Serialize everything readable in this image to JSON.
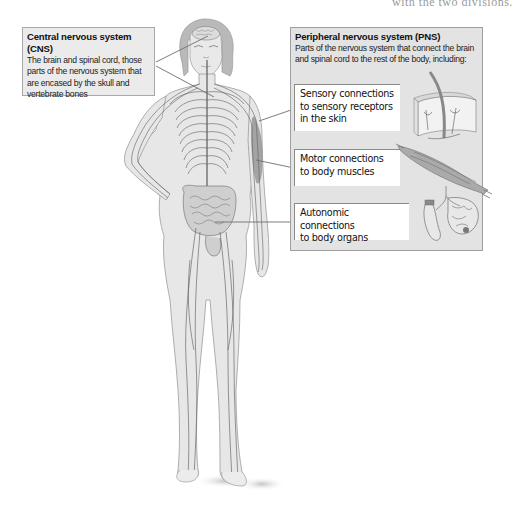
{
  "page": {
    "top_cut_text": "with the two divisions."
  },
  "cns": {
    "title": "Central nervous system (CNS)",
    "description_lines": [
      "The brain and spinal cord, those",
      "parts of the nervous system that",
      "are encased by the skull and",
      "vertebrate bones"
    ]
  },
  "pns": {
    "title": "Peripheral nervous system (PNS)",
    "description_lines": [
      "Parts of the nervous system that connect the brain",
      "and spinal cord to the rest of the body, including:"
    ],
    "items": [
      {
        "label_lines": [
          "Sensory connections",
          "to sensory receptors",
          "in the skin"
        ],
        "illustration": "skin-cross-section-icon"
      },
      {
        "label_lines": [
          "Motor connections",
          "to body muscles"
        ],
        "illustration": "muscle-icon"
      },
      {
        "label_lines": [
          "Autonomic connections",
          "to body organs"
        ],
        "illustration": "organs-icon"
      }
    ]
  },
  "colors": {
    "cns_box_fill": "#ebebeb",
    "pns_box_fill": "#e3e3e3",
    "box_border": "#9f9f9f",
    "body_fill": "#e6e6e6",
    "body_outline": "#9a9a9a",
    "nerve": "#5a5a5a",
    "leader_line": "#707070"
  }
}
